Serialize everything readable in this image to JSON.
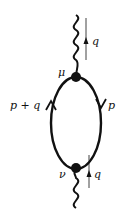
{
  "diagram": {
    "type": "feynman-diagram",
    "labels": {
      "top_momentum": "q",
      "bottom_momentum": "q",
      "top_vertex": "μ",
      "bottom_vertex": "ν",
      "left_propagator": "p + q",
      "right_propagator": "p"
    },
    "colors": {
      "ink": "#111111"
    }
  }
}
